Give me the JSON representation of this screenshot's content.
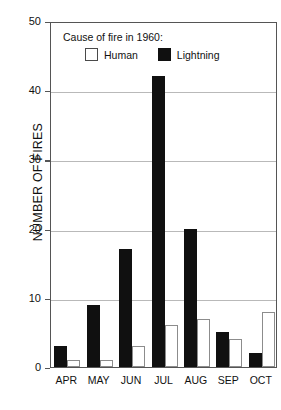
{
  "chart_data": {
    "type": "bar",
    "title": "",
    "subtitle": "",
    "xlabel": "",
    "ylabel": "NUMBER OF FIRES",
    "categories": [
      "APR",
      "MAY",
      "JUN",
      "JUL",
      "AUG",
      "SEP",
      "OCT"
    ],
    "series": [
      {
        "name": "Lightning",
        "color": "#101010",
        "values": [
          3,
          9,
          17,
          42,
          20,
          5,
          2
        ]
      },
      {
        "name": "Human",
        "color": "#ffffff",
        "values": [
          1,
          1,
          3,
          6,
          7,
          4,
          8
        ]
      }
    ],
    "ylim": [
      0,
      50
    ],
    "yticks": [
      0,
      10,
      20,
      30,
      40,
      50
    ],
    "ytick_labels": [
      "0",
      "10",
      "20",
      "30",
      "40",
      "50"
    ],
    "grid": true,
    "grid_axis": "y",
    "legend_position": "inside-top-left",
    "legend": {
      "title": "Cause of fire in 1960:",
      "entries": [
        {
          "label": "Human",
          "swatch": "open-square-swatch"
        },
        {
          "label": "Lightning",
          "swatch": "filled-square-swatch"
        }
      ]
    },
    "annotations": []
  }
}
